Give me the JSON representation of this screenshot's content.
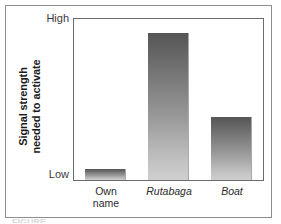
{
  "figure": {
    "caption_partial": "FIGURE",
    "axis_title": {
      "line1": "Signal strength",
      "line2": "needed to activate"
    }
  },
  "chart_data": {
    "type": "bar",
    "title": "",
    "xlabel": "",
    "ylabel": "Signal strength needed to activate",
    "categories": [
      "Own name",
      "Rutabaga",
      "Boat"
    ],
    "category_labels": [
      {
        "line1": "Own",
        "line2": "name",
        "italic": false
      },
      {
        "line1": "Rutabaga",
        "line2": "",
        "italic": true
      },
      {
        "line1": "Boat",
        "line2": "",
        "italic": true
      }
    ],
    "values": [
      7,
      91,
      39
    ],
    "ylim": [
      0,
      100
    ],
    "ytick_labels": [
      "Low",
      "High"
    ],
    "ytick_values": [
      0,
      100
    ],
    "grid": false,
    "legend": "none",
    "bar_fill": "#7d7d7d",
    "bar_gradient_top": "#555555",
    "bar_gradient_bottom": "#cfcfcf",
    "frame_color": "#6b6b6b"
  }
}
